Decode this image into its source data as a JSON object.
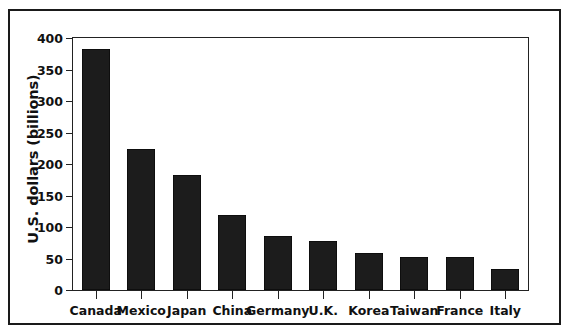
{
  "chart_data": {
    "type": "bar",
    "title": "",
    "subtitle": "",
    "xlabel": "",
    "ylabel": "U.S. dollars (billions)",
    "categories": [
      "Canada",
      "Mexico",
      "Japan",
      "China",
      "Germany",
      "U.K.",
      "Korea",
      "Taiwan",
      "France",
      "Italy"
    ],
    "values": [
      382,
      224,
      182,
      119,
      86,
      78,
      58,
      53,
      52,
      33
    ],
    "ylim": [
      0,
      400
    ],
    "yticks": [
      0,
      50,
      100,
      150,
      200,
      250,
      300,
      350,
      400
    ],
    "ytick_labels": [
      "0",
      "50",
      "100",
      "150",
      "200",
      "250",
      "300",
      "350",
      "400"
    ],
    "grid": false,
    "legend": null,
    "legend_position": "none",
    "bar_color": "#1c1c1c",
    "axis_color": "#222222",
    "frame_color": "#1a1a1a",
    "background": "#ffffff",
    "annotations": []
  }
}
